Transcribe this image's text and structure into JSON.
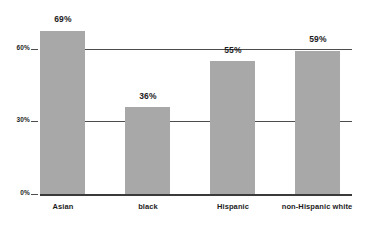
{
  "chart_data": {
    "type": "bar",
    "title": "",
    "subtitle": "",
    "xlabel": "",
    "ylabel": "",
    "categories": [
      "Asian",
      "black",
      "Hispanic",
      "non-Hispanic white"
    ],
    "values": [
      69,
      36,
      55,
      59
    ],
    "value_labels": [
      "69%",
      "36%",
      "55%",
      "59%"
    ],
    "ylim": [
      0,
      75
    ],
    "y_ticks": [
      0,
      30,
      60
    ],
    "y_tick_labels": [
      "0%",
      "30%",
      "60%"
    ],
    "grid": true,
    "gridlines_at": [
      30,
      60
    ],
    "legend": null,
    "legend_position": "none",
    "series": [
      {
        "name": "",
        "values": [
          69,
          36,
          55,
          59
        ]
      }
    ],
    "annotations": []
  },
  "style": {
    "bar_color": "#a8a8a8",
    "gridline_color": "#4d4d4d",
    "axis_color": "#3a3a3a",
    "text_color": "#1c1c1c",
    "background": "#ffffff"
  },
  "bars": [
    {
      "category": "Asian",
      "value_label": "69%",
      "left": 40,
      "width": 45,
      "top": 31,
      "height": 163,
      "label_left": 30,
      "label_top": 15,
      "label_width": 66,
      "cat_left": 25,
      "cat_top": 203,
      "cat_width": 76
    },
    {
      "category": "black",
      "value_label": "36%",
      "left": 125,
      "width": 45,
      "top": 107,
      "height": 87,
      "label_left": 115,
      "label_top": 92,
      "label_width": 66,
      "cat_left": 110,
      "cat_top": 203,
      "cat_width": 76
    },
    {
      "category": "Hispanic",
      "value_label": "55%",
      "left": 210,
      "width": 45,
      "top": 61,
      "height": 133,
      "label_left": 200,
      "label_top": 46,
      "label_width": 66,
      "cat_left": 195,
      "cat_top": 203,
      "cat_width": 76
    },
    {
      "category": "non-Hispanic white",
      "value_label": "59%",
      "left": 295,
      "width": 45,
      "top": 51,
      "height": 143,
      "label_left": 285,
      "label_top": 35,
      "label_width": 66,
      "cat_left": 268,
      "cat_top": 203,
      "cat_width": 98
    }
  ],
  "y_axis": [
    {
      "label": "60%",
      "tick_top": 49,
      "label_top": 45,
      "label_left": 4,
      "tick_left": 31
    },
    {
      "label": "30%",
      "tick_top": 121,
      "label_top": 117,
      "label_left": 4,
      "tick_left": 31
    },
    {
      "label": "0%",
      "tick_top": 194,
      "label_top": 190,
      "label_left": 4,
      "tick_left": 31
    }
  ],
  "gridlines": [
    {
      "value": 60,
      "top": 49
    },
    {
      "value": 30,
      "top": 121
    }
  ],
  "baseline": {
    "top": 194
  }
}
